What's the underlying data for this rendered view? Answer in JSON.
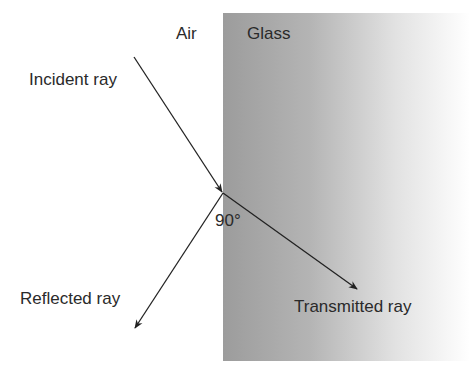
{
  "media": {
    "left": "Air",
    "right": "Glass"
  },
  "rays": {
    "incident": "Incident ray",
    "reflected": "Reflected ray",
    "transmitted": "Transmitted ray"
  },
  "angle_label": "90°",
  "colors": {
    "glass_dark": "#9a9a9a",
    "glass_light": "#ffffff",
    "ray": "#222222",
    "text": "#2a2a2a"
  }
}
